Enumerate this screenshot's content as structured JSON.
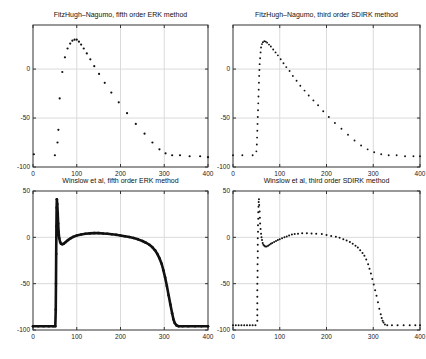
{
  "figure": {
    "background": "#ffffff",
    "grid_color": "#dadada",
    "axis_color": "#333333",
    "marker_color": "#111111",
    "text_color": "#1a1a1a"
  },
  "chart_data": [
    {
      "type": "scatter",
      "title": "FitzHugh–Nagumo, fifth order ERK method",
      "xlabel": "",
      "ylabel": "",
      "xlim": [
        0,
        400
      ],
      "ylim": [
        -100,
        45
      ],
      "xticks": [
        0,
        100,
        200,
        300,
        400
      ],
      "yticks": [
        0,
        -50,
        -100
      ],
      "grid": true,
      "legend": null,
      "style": "dots",
      "marker_size": 1.1,
      "points": [
        [
          2,
          -87
        ],
        [
          50,
          -88
        ],
        [
          56,
          -75
        ],
        [
          58,
          -62
        ],
        [
          61,
          -30
        ],
        [
          67,
          -3
        ],
        [
          73,
          12
        ],
        [
          79,
          21
        ],
        [
          85,
          26
        ],
        [
          90,
          29
        ],
        [
          95,
          30
        ],
        [
          100,
          30
        ],
        [
          105,
          28
        ],
        [
          110,
          25
        ],
        [
          116,
          21
        ],
        [
          123,
          16
        ],
        [
          131,
          10
        ],
        [
          140,
          3
        ],
        [
          151,
          -5
        ],
        [
          164,
          -14
        ],
        [
          179,
          -24
        ],
        [
          196,
          -34
        ],
        [
          215,
          -45
        ],
        [
          235,
          -56
        ],
        [
          255,
          -66
        ],
        [
          273,
          -75
        ],
        [
          289,
          -82
        ],
        [
          303,
          -86
        ],
        [
          318,
          -88
        ],
        [
          336,
          -88
        ],
        [
          358,
          -89
        ],
        [
          382,
          -89
        ],
        [
          400,
          -90
        ]
      ]
    },
    {
      "type": "scatter",
      "title": "FitzHugh–Nagumo, third order SDIRK method",
      "xlabel": "",
      "ylabel": "",
      "xlim": [
        0,
        400
      ],
      "ylim": [
        -100,
        45
      ],
      "xticks": [
        0,
        100,
        200,
        300,
        400
      ],
      "yticks": [
        0,
        -50,
        -100
      ],
      "grid": true,
      "legend": null,
      "style": "dots",
      "marker_size": 0.95,
      "points": [
        [
          0,
          -88
        ],
        [
          20,
          -88
        ],
        [
          42,
          -88
        ],
        [
          50,
          -84
        ],
        [
          51,
          -77
        ],
        [
          51.5,
          -70
        ],
        [
          52,
          -63
        ],
        [
          52.5,
          -56
        ],
        [
          53,
          -49
        ],
        [
          53.5,
          -42
        ],
        [
          54,
          -35
        ],
        [
          54.5,
          -28
        ],
        [
          55,
          -21
        ],
        [
          55.5,
          -14
        ],
        [
          56,
          -7
        ],
        [
          56.5,
          -1
        ],
        [
          57,
          5
        ],
        [
          58,
          11
        ],
        [
          59,
          17
        ],
        [
          60,
          22
        ],
        [
          62,
          25.5
        ],
        [
          64,
          27.5
        ],
        [
          67,
          28.5
        ],
        [
          70,
          28
        ],
        [
          73,
          27
        ],
        [
          77,
          25
        ],
        [
          81,
          23
        ],
        [
          86,
          20
        ],
        [
          91,
          17
        ],
        [
          96,
          14
        ],
        [
          102,
          10
        ],
        [
          108,
          6
        ],
        [
          114,
          2
        ],
        [
          121,
          -2
        ],
        [
          128,
          -7
        ],
        [
          136,
          -12
        ],
        [
          144,
          -17
        ],
        [
          153,
          -22
        ],
        [
          162,
          -27
        ],
        [
          172,
          -32
        ],
        [
          182,
          -37
        ],
        [
          193,
          -43
        ],
        [
          205,
          -49
        ],
        [
          218,
          -55
        ],
        [
          232,
          -61
        ],
        [
          246,
          -67
        ],
        [
          260,
          -73
        ],
        [
          274,
          -78
        ],
        [
          288,
          -82
        ],
        [
          302,
          -85
        ],
        [
          317,
          -87
        ],
        [
          333,
          -88
        ],
        [
          350,
          -88
        ],
        [
          368,
          -89
        ],
        [
          386,
          -89
        ],
        [
          400,
          -89
        ]
      ]
    },
    {
      "type": "line",
      "title": "Winslow et al, fifth order ERK method",
      "xlabel": "",
      "ylabel": "",
      "xlim": [
        0,
        400
      ],
      "ylim": [
        -100,
        50
      ],
      "xticks": [
        0,
        100,
        200,
        300,
        400
      ],
      "yticks": [
        50,
        0,
        -50,
        -100
      ],
      "grid": true,
      "legend": null,
      "style": "line-dots",
      "line_width": 2.6,
      "marker_size": 1.3,
      "points": [
        [
          0,
          -96
        ],
        [
          12,
          -96
        ],
        [
          24,
          -96
        ],
        [
          36,
          -96
        ],
        [
          46,
          -96
        ],
        [
          51,
          -96
        ],
        [
          52,
          -78
        ],
        [
          52.5,
          -50
        ],
        [
          53,
          -18
        ],
        [
          53.5,
          12
        ],
        [
          54,
          32
        ],
        [
          54.5,
          41
        ],
        [
          55.5,
          36
        ],
        [
          56.5,
          26
        ],
        [
          57.5,
          15
        ],
        [
          58.5,
          6
        ],
        [
          60,
          -1
        ],
        [
          62,
          -5
        ],
        [
          64,
          -7
        ],
        [
          67,
          -7.5
        ],
        [
          70,
          -7
        ],
        [
          75,
          -5
        ],
        [
          80,
          -3
        ],
        [
          86,
          -1
        ],
        [
          92,
          0.5
        ],
        [
          100,
          2
        ],
        [
          110,
          3
        ],
        [
          120,
          3.8
        ],
        [
          130,
          4.3
        ],
        [
          140,
          4.5
        ],
        [
          150,
          4.5
        ],
        [
          160,
          4.2
        ],
        [
          170,
          3.8
        ],
        [
          180,
          3.3
        ],
        [
          190,
          2.7
        ],
        [
          200,
          2
        ],
        [
          210,
          1.2
        ],
        [
          220,
          0.3
        ],
        [
          230,
          -0.8
        ],
        [
          240,
          -2.2
        ],
        [
          250,
          -4
        ],
        [
          258,
          -5.8
        ],
        [
          266,
          -8
        ],
        [
          273,
          -10.8
        ],
        [
          279,
          -14
        ],
        [
          284,
          -17.8
        ],
        [
          289,
          -22.5
        ],
        [
          294,
          -28.5
        ],
        [
          298,
          -35.5
        ],
        [
          302,
          -43.5
        ],
        [
          306,
          -52.5
        ],
        [
          310,
          -62.5
        ],
        [
          314,
          -72.5
        ],
        [
          318,
          -82
        ],
        [
          321,
          -88.5
        ],
        [
          324,
          -92.5
        ],
        [
          328,
          -95
        ],
        [
          333,
          -96
        ],
        [
          342,
          -96
        ],
        [
          355,
          -96
        ],
        [
          370,
          -96
        ],
        [
          385,
          -96
        ],
        [
          400,
          -96
        ]
      ]
    },
    {
      "type": "scatter",
      "title": "Winslow et al, third order SDIRK method",
      "xlabel": "",
      "ylabel": "",
      "xlim": [
        0,
        400
      ],
      "ylim": [
        -100,
        50
      ],
      "xticks": [
        0,
        100,
        200,
        300,
        400
      ],
      "yticks": [
        50,
        0,
        -50,
        -100
      ],
      "grid": true,
      "legend": null,
      "style": "dots",
      "marker_size": 1.0,
      "points": [
        [
          0,
          -95
        ],
        [
          6,
          -95
        ],
        [
          12,
          -95
        ],
        [
          18,
          -95
        ],
        [
          24,
          -95
        ],
        [
          30,
          -95
        ],
        [
          36,
          -95
        ],
        [
          42,
          -95
        ],
        [
          48,
          -95
        ],
        [
          52,
          -90
        ],
        [
          52,
          -84
        ],
        [
          52,
          -78
        ],
        [
          52,
          -71
        ],
        [
          52,
          -64
        ],
        [
          52,
          -57
        ],
        [
          52,
          -50
        ],
        [
          52.5,
          -43
        ],
        [
          52.5,
          -36
        ],
        [
          52.5,
          -29
        ],
        [
          53,
          -22
        ],
        [
          53,
          -15
        ],
        [
          53,
          -8
        ],
        [
          53,
          -1
        ],
        [
          53.5,
          6
        ],
        [
          53.5,
          13
        ],
        [
          54,
          20
        ],
        [
          54,
          27
        ],
        [
          54.5,
          33
        ],
        [
          55,
          38
        ],
        [
          55.5,
          41
        ],
        [
          56,
          35
        ],
        [
          57,
          28
        ],
        [
          57.5,
          21
        ],
        [
          58,
          15
        ],
        [
          59,
          9
        ],
        [
          60,
          4
        ],
        [
          61,
          0
        ],
        [
          62,
          -3
        ],
        [
          63.5,
          -6
        ],
        [
          65,
          -8
        ],
        [
          67,
          -9
        ],
        [
          69,
          -10
        ],
        [
          72,
          -10
        ],
        [
          75,
          -9
        ],
        [
          78,
          -8
        ],
        [
          81,
          -7
        ],
        [
          84,
          -6
        ],
        [
          88,
          -5
        ],
        [
          92,
          -4
        ],
        [
          96,
          -3
        ],
        [
          100,
          -2
        ],
        [
          105,
          -1
        ],
        [
          110,
          0
        ],
        [
          115,
          1
        ],
        [
          120,
          2
        ],
        [
          126,
          3
        ],
        [
          132,
          3.5
        ],
        [
          139,
          4
        ],
        [
          148,
          4.5
        ],
        [
          158,
          4.5
        ],
        [
          168,
          4.2
        ],
        [
          178,
          4
        ],
        [
          190,
          3.5
        ],
        [
          200,
          2.5
        ],
        [
          210,
          1.5
        ],
        [
          220,
          0.5
        ],
        [
          228,
          -0.5
        ],
        [
          236,
          -2
        ],
        [
          243,
          -3.5
        ],
        [
          250,
          -5
        ],
        [
          256,
          -7
        ],
        [
          262,
          -9
        ],
        [
          267,
          -11
        ],
        [
          272,
          -14
        ],
        [
          277,
          -17
        ],
        [
          281,
          -20
        ],
        [
          285,
          -24
        ],
        [
          289,
          -29
        ],
        [
          292,
          -34
        ],
        [
          295,
          -39
        ],
        [
          298,
          -45
        ],
        [
          301,
          -51
        ],
        [
          304,
          -57
        ],
        [
          307,
          -63
        ],
        [
          310,
          -70
        ],
        [
          313,
          -77
        ],
        [
          316,
          -83
        ],
        [
          318,
          -87
        ],
        [
          320,
          -90
        ],
        [
          322,
          -92
        ],
        [
          325,
          -94
        ],
        [
          330,
          -95
        ],
        [
          340,
          -95
        ],
        [
          352,
          -95
        ],
        [
          365,
          -95
        ],
        [
          378,
          -95
        ],
        [
          390,
          -95
        ],
        [
          400,
          -95
        ]
      ]
    }
  ]
}
